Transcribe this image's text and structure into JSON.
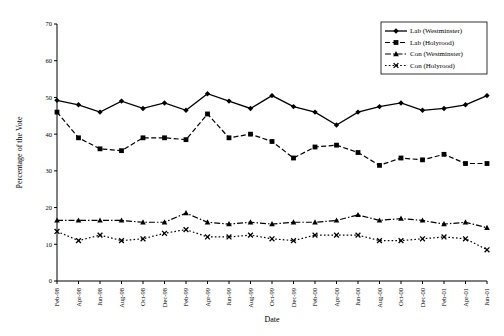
{
  "chart_data": {
    "type": "line",
    "title": "",
    "xlabel": "Date",
    "ylabel": "Percentage of the Vote",
    "ylim": [
      0,
      70
    ],
    "ytick_values": [
      0,
      10,
      20,
      30,
      40,
      50,
      60,
      70
    ],
    "grid": false,
    "legend_position": "top-right",
    "categories": [
      "Feb-98",
      "Apr-98",
      "Jun-98",
      "Aug-98",
      "Oct-98",
      "Dec-98",
      "Feb-99",
      "Apr-99",
      "Jun-99",
      "Aug-99",
      "Oct-99",
      "Dec-99",
      "Feb-00",
      "Apr-00",
      "Jun-00",
      "Aug-00",
      "Oct-00",
      "Dec-00",
      "Feb-01",
      "Apr-01",
      "Jun-01"
    ],
    "series": [
      {
        "name": "Lab (Westminster)",
        "marker": "diamond",
        "dash": "solid",
        "color": "#000000",
        "values": [
          49.2,
          48.0,
          46.0,
          49.0,
          47.0,
          48.5,
          46.5,
          51.0,
          49.0,
          47.0,
          50.5,
          47.5,
          46.0,
          42.5,
          46.0,
          47.5,
          48.5,
          46.5,
          47.0,
          48.0,
          50.5
        ]
      },
      {
        "name": "Lab (Holyrood)",
        "marker": "square",
        "dash": "dashed",
        "color": "#000000",
        "values": [
          46.0,
          39.0,
          36.0,
          35.5,
          39.0,
          39.0,
          38.5,
          45.5,
          39.0,
          40.0,
          38.0,
          33.5,
          36.5,
          37.0,
          35.0,
          31.5,
          33.5,
          33.0,
          34.5,
          32.0,
          32.0
        ]
      },
      {
        "name": "Con (Westminster)",
        "marker": "triangle",
        "dash": "dashdot",
        "color": "#000000",
        "values": [
          16.5,
          16.5,
          16.5,
          16.5,
          16.0,
          16.0,
          18.5,
          16.0,
          15.5,
          16.0,
          15.5,
          16.0,
          16.0,
          16.5,
          18.0,
          16.5,
          17.0,
          16.5,
          15.5,
          16.0,
          14.5
        ]
      },
      {
        "name": "Con (Holyrood)",
        "marker": "cross",
        "dash": "dotted",
        "color": "#000000",
        "values": [
          13.5,
          11.0,
          12.5,
          11.0,
          11.5,
          13.0,
          14.0,
          12.0,
          12.0,
          12.5,
          11.5,
          11.0,
          12.5,
          12.5,
          12.5,
          11.0,
          11.0,
          11.5,
          12.0,
          11.5,
          8.5
        ]
      }
    ]
  }
}
